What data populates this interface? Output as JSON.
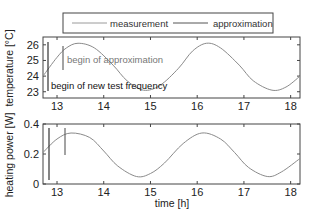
{
  "legend": {
    "items": [
      {
        "label": "measurement",
        "color": "#9a9a9a"
      },
      {
        "label": "approximation",
        "color": "#555555"
      }
    ]
  },
  "chart_data": [
    {
      "type": "line",
      "title": "",
      "xlabel": "",
      "ylabel": "temperature [°C]",
      "xlim": [
        12.7,
        18.2
      ],
      "ylim": [
        22.6,
        26.5
      ],
      "xticks": [
        13,
        14,
        15,
        16,
        17,
        18
      ],
      "yticks": [
        23,
        24,
        25,
        26
      ],
      "grid": false,
      "series": [
        {
          "name": "measurement",
          "x": [
            12.7,
            13.0,
            13.2,
            13.45,
            13.8,
            14.2,
            14.5,
            14.85,
            15.2,
            15.6,
            15.9,
            16.2,
            16.5,
            16.9,
            17.2,
            17.6,
            17.9,
            18.2
          ],
          "values": [
            24.0,
            25.2,
            25.8,
            26.1,
            25.8,
            24.7,
            23.7,
            23.1,
            23.4,
            24.5,
            25.6,
            26.1,
            25.8,
            24.7,
            23.7,
            23.1,
            23.3,
            24.0
          ]
        }
      ],
      "annotations": [
        {
          "text": "begin of approximation",
          "x": 13.12
        },
        {
          "text": "begin of new test frequency",
          "x": 12.78
        }
      ]
    },
    {
      "type": "line",
      "title": "",
      "xlabel": "time [h]",
      "ylabel": "heating power [W]",
      "xlim": [
        12.7,
        18.2
      ],
      "ylim": [
        0,
        0.4
      ],
      "xticks": [
        13,
        14,
        15,
        16,
        17,
        18
      ],
      "yticks": [
        0,
        0.2,
        0.4
      ],
      "grid": false,
      "series": [
        {
          "name": "measurement",
          "x": [
            12.7,
            13.0,
            13.3,
            13.7,
            14.0,
            14.3,
            14.7,
            15.0,
            15.3,
            15.7,
            16.1,
            16.5,
            16.8,
            17.1,
            17.5,
            17.8,
            18.2
          ],
          "values": [
            0.21,
            0.3,
            0.34,
            0.31,
            0.22,
            0.12,
            0.05,
            0.07,
            0.14,
            0.27,
            0.34,
            0.3,
            0.21,
            0.11,
            0.05,
            0.08,
            0.17
          ]
        }
      ],
      "markers": [
        12.78,
        13.12
      ]
    }
  ]
}
